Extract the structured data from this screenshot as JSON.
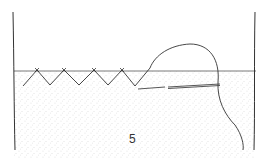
{
  "figure": {
    "label": "5",
    "stitch_count": 5,
    "colors": {
      "line": "#333333",
      "stipple": "#8a8a8a",
      "background": "#ffffff"
    }
  }
}
